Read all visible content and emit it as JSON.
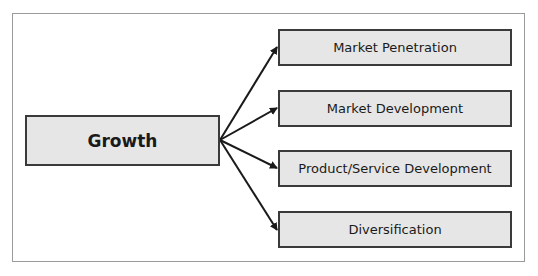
{
  "diagram": {
    "root": {
      "label": "Growth"
    },
    "branches": [
      {
        "label": "Market Penetration"
      },
      {
        "label": "Market Development"
      },
      {
        "label": "Product/Service Development"
      },
      {
        "label": "Diversification"
      }
    ],
    "colors": {
      "box_fill": "#e6e6e6",
      "box_border": "#3a3a3a",
      "arrow": "#1a1a1a",
      "frame": "#9a9a9a"
    }
  }
}
